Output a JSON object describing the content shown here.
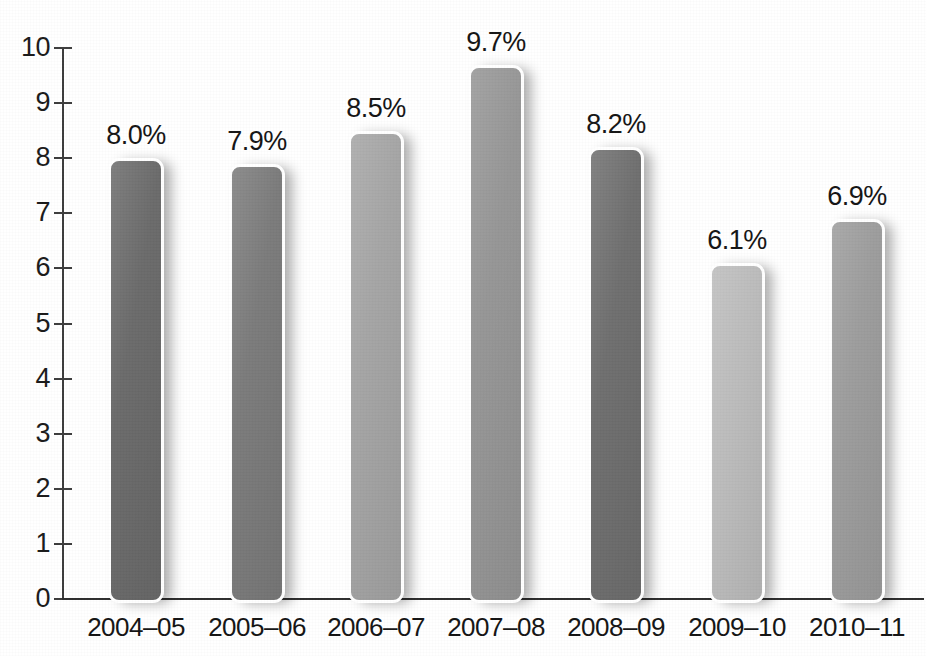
{
  "chart_data": {
    "type": "bar",
    "title": "",
    "subtitle": "",
    "xlabel": "",
    "ylabel": "",
    "ylim": [
      0,
      10
    ],
    "ytick_step": 1,
    "ytick_labels": [
      "10",
      "9",
      "8",
      "7",
      "6",
      "5",
      "4",
      "3",
      "2",
      "1",
      "0"
    ],
    "grid": false,
    "legend": "none",
    "categories": [
      "2004–05",
      "2005–06",
      "2006–07",
      "2007–08",
      "2008–09",
      "2009–10",
      "2010–11"
    ],
    "values": [
      8.0,
      7.9,
      8.5,
      9.7,
      8.2,
      6.1,
      6.9
    ],
    "data_labels": [
      "8.0%",
      "7.9%",
      "8.5%",
      "9.7%",
      "8.2%",
      "6.1%",
      "6.9%"
    ],
    "bar_colors": [
      "#6b6b6b",
      "#7b7b7b",
      "#a5a5a5",
      "#969696",
      "#6f6f6f",
      "#bcbcbc",
      "#9d9d9d"
    ]
  },
  "axes": {
    "axis_color": "#3c3c3c",
    "baseline_color": "#2e2e2e",
    "label_color": "#141414"
  },
  "background": "#ffffff"
}
